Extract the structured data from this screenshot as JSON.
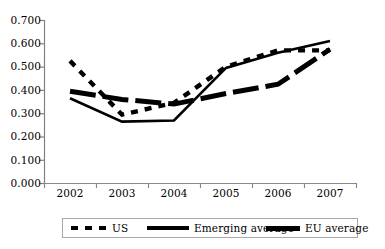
{
  "chart_data": {
    "type": "line",
    "title": "",
    "xlabel": "",
    "ylabel": "",
    "categories": [
      "2002",
      "2003",
      "2004",
      "2005",
      "2006",
      "2007"
    ],
    "x": [
      2002,
      2003,
      2004,
      2005,
      2006,
      2007
    ],
    "ylim": [
      0.0,
      0.7
    ],
    "ytick_labels": [
      "0.000",
      "0.100",
      "0.200",
      "0.300",
      "0.400",
      "0.500",
      "0.600",
      "0.700"
    ],
    "yticks": [
      0.0,
      0.1,
      0.2,
      0.3,
      0.4,
      0.5,
      0.6,
      0.7
    ],
    "grid": false,
    "legend_position": "bottom",
    "series": [
      {
        "name": "US",
        "style": "dotted",
        "color": "#000000",
        "values": [
          0.525,
          0.295,
          0.345,
          0.5,
          0.57,
          0.57
        ]
      },
      {
        "name": "Emerging average",
        "style": "solid",
        "color": "#000000",
        "values": [
          0.365,
          0.265,
          0.27,
          0.495,
          0.56,
          0.61
        ]
      },
      {
        "name": "EU average",
        "style": "dashed-thick",
        "color": "#000000",
        "values": [
          0.395,
          0.36,
          0.34,
          0.385,
          0.425,
          0.575
        ]
      }
    ]
  },
  "axes": {
    "y_labels": [
      "0.700",
      "0.600",
      "0.500",
      "0.400",
      "0.300",
      "0.200",
      "0.100",
      "0.000"
    ],
    "x_labels": [
      "2002",
      "2003",
      "2004",
      "2005",
      "2006",
      "2007"
    ]
  },
  "legend": {
    "items": [
      {
        "label": "US",
        "swatch": "dotted-line-swatch"
      },
      {
        "label": "Emerging average",
        "swatch": "solid-line-swatch"
      },
      {
        "label": "EU average",
        "swatch": "thick-line-swatch"
      }
    ]
  }
}
